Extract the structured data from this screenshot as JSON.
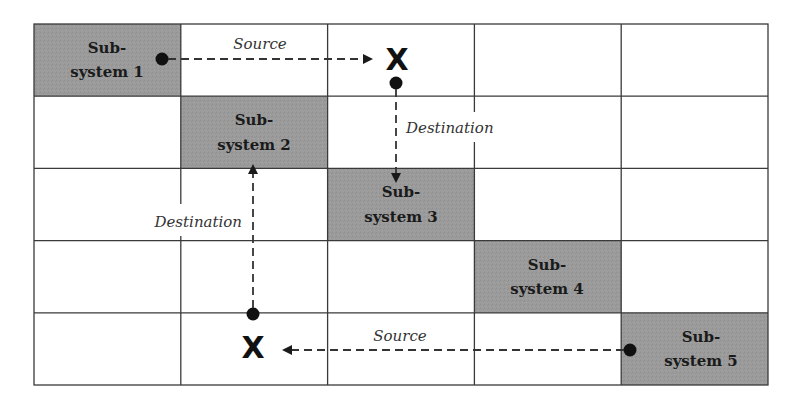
{
  "diagram": {
    "colors": {
      "grid_line": "#3a3a3a",
      "subsystem_fill": "#9b9b9b",
      "arrow": "#333333",
      "marker": "#111111"
    },
    "grid": {
      "columns": 5,
      "rows": 5
    },
    "subsystems": [
      {
        "line1": "Sub-",
        "line2": "system 1",
        "row": 0,
        "col": 0
      },
      {
        "line1": "Sub-",
        "line2": "system 2",
        "row": 1,
        "col": 1
      },
      {
        "line1": "Sub-",
        "line2": "system 3",
        "row": 2,
        "col": 2
      },
      {
        "line1": "Sub-",
        "line2": "system 4",
        "row": 3,
        "col": 3
      },
      {
        "line1": "Sub-",
        "line2": "system 5",
        "row": 4,
        "col": 4
      }
    ],
    "flows": {
      "top_source_label": "Source",
      "top_destination_label": "Destination",
      "bottom_source_label": "Source",
      "bottom_destination_label": "Destination"
    },
    "markers": {
      "top_x": "X",
      "bottom_x": "X"
    }
  }
}
